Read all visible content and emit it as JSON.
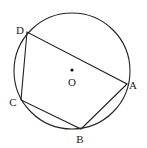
{
  "figure": {
    "type": "cyclic-quadrilateral",
    "stroke_color": "#222222",
    "background": "#ffffff",
    "circle": {
      "center": {
        "x": 72,
        "y": 71
      },
      "radius": 58,
      "center_label": "O"
    },
    "points": [
      {
        "name": "A",
        "label": "A",
        "x": 127,
        "y": 84,
        "label_x": 133,
        "label_y": 89
      },
      {
        "name": "B",
        "label": "B",
        "x": 81,
        "y": 129,
        "label_x": 80,
        "label_y": 143
      },
      {
        "name": "C",
        "label": "C",
        "x": 21,
        "y": 100,
        "label_x": 13,
        "label_y": 106
      },
      {
        "name": "D",
        "label": "D",
        "x": 27,
        "y": 32,
        "label_x": 20,
        "label_y": 34
      }
    ],
    "segments": [
      "DA",
      "AB",
      "BC",
      "CD"
    ],
    "labels": {
      "A": "A",
      "B": "B",
      "C": "C",
      "D": "D",
      "O": "O"
    }
  }
}
